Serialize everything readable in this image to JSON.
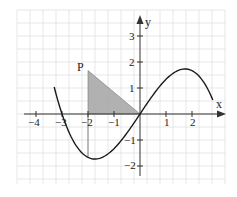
{
  "chart_data": {
    "type": "line",
    "title": "",
    "xlabel": "x",
    "ylabel": "y",
    "xlim": [
      -4.6,
      3.3
    ],
    "ylim": [
      -2.6,
      3.7
    ],
    "grid": true,
    "grid_step": 0.5,
    "x_ticks": [
      {
        "value": -4,
        "label": "−4"
      },
      {
        "value": -3,
        "label": "−3"
      },
      {
        "value": -2,
        "label": "−2"
      },
      {
        "value": -1,
        "label": "−1"
      },
      {
        "value": 1,
        "label": "1"
      },
      {
        "value": 2,
        "label": "2"
      }
    ],
    "y_ticks": [
      {
        "value": 3,
        "label": "3"
      },
      {
        "value": 2,
        "label": "2"
      },
      {
        "value": 1,
        "label": "1"
      },
      {
        "value": -1,
        "label": "−1"
      },
      {
        "value": -2,
        "label": "−2"
      }
    ],
    "series": [
      {
        "name": "f(x)",
        "description": "cubic curve with zeros at x=-3, 0, 3; local max near (-1.73, 1.73), local min near (1.73, -1.73)",
        "x": [
          -3.3,
          -3,
          -2.5,
          -2,
          -1.73,
          -1.5,
          -1,
          -0.5,
          0,
          0.5,
          1,
          1.5,
          1.73,
          2,
          2.5,
          2.8
        ],
        "y": [
          -0.99,
          0,
          1.15,
          1.67,
          1.73,
          1.69,
          1.33,
          0.73,
          0,
          -0.73,
          -1.33,
          -1.69,
          -1.73,
          -1.67,
          -1.15,
          -0.55
        ]
      }
    ],
    "annotations": [
      {
        "type": "point",
        "label": "P",
        "x": -2,
        "y": 1.67
      },
      {
        "type": "shaded-triangle",
        "vertices": [
          [
            -2,
            0
          ],
          [
            -2,
            1.67
          ],
          [
            0,
            0
          ]
        ],
        "fill": "#a9a9a9"
      }
    ]
  },
  "labels": {
    "x_axis": "x",
    "y_axis": "y",
    "point_p": "P",
    "x_ticks": [
      "−4",
      "−3",
      "−2",
      "−1",
      "1",
      "2"
    ],
    "y_ticks": [
      "3",
      "2",
      "1",
      "−1",
      "−2"
    ]
  },
  "colors": {
    "grid": "#dcdcdc",
    "axis": "#333333",
    "curve": "#1a1a1a",
    "shade": "#a9a9a9"
  }
}
